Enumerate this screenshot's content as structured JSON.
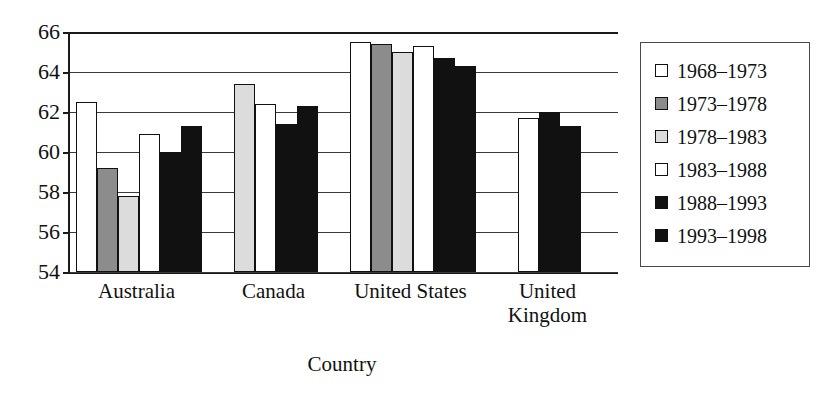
{
  "chart_data": {
    "type": "bar",
    "title": "",
    "xlabel": "Country",
    "ylabel": "",
    "ylim": [
      54,
      66
    ],
    "yticks": [
      54,
      56,
      58,
      60,
      62,
      64,
      66
    ],
    "grid": true,
    "legend_position": "right",
    "categories": [
      "Australia",
      "Canada",
      "United States",
      "United Kingdom"
    ],
    "category_display": [
      "Australia",
      "Canada",
      "United States",
      "United\nKingdom"
    ],
    "series": [
      {
        "name": "1968–1973",
        "color": "#ffffff",
        "values": [
          62.5,
          null,
          65.5,
          null
        ]
      },
      {
        "name": "1973–1978",
        "color": "#8c8c8c",
        "values": [
          59.2,
          null,
          65.4,
          null
        ]
      },
      {
        "name": "1978–1983",
        "color": "#dcdcdc",
        "values": [
          57.8,
          63.4,
          65.0,
          null
        ]
      },
      {
        "name": "1983–1988",
        "color": "#ffffff",
        "values": [
          60.9,
          62.4,
          65.3,
          61.7
        ]
      },
      {
        "name": "1988–1993",
        "color": "#111111",
        "values": [
          60.0,
          61.4,
          64.7,
          62.0
        ]
      },
      {
        "name": "1993–1998",
        "color": "#111111",
        "values": [
          61.3,
          62.3,
          64.3,
          61.3
        ]
      }
    ]
  },
  "legend": {
    "items": [
      {
        "label": "1968–1973",
        "swatch": "#ffffff"
      },
      {
        "label": "1973–1978",
        "swatch": "#8c8c8c"
      },
      {
        "label": "1978–1983",
        "swatch": "#dcdcdc"
      },
      {
        "label": "1983–1988",
        "swatch": "#ffffff"
      },
      {
        "label": "1988–1993",
        "swatch": "#111111"
      },
      {
        "label": "1993–1998",
        "swatch": "#111111"
      }
    ]
  }
}
